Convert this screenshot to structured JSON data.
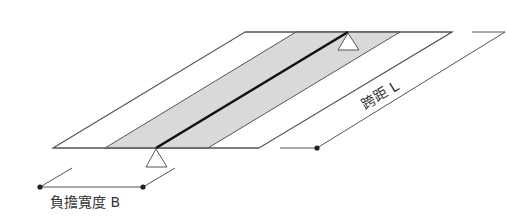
{
  "diagram": {
    "title": "",
    "labels": {
      "span": "跨距 L",
      "width": "負擔寬度 B"
    },
    "colors": {
      "outline": "#555555",
      "band_fill": "#d9d9d9",
      "beam": "#111111",
      "dimension": "#555555",
      "dot": "#222222",
      "text": "#333333"
    },
    "elements": [
      "slab-parallelogram",
      "tributary-band",
      "beam-line",
      "support-top",
      "support-bottom",
      "span-dimension",
      "width-dimension"
    ]
  }
}
